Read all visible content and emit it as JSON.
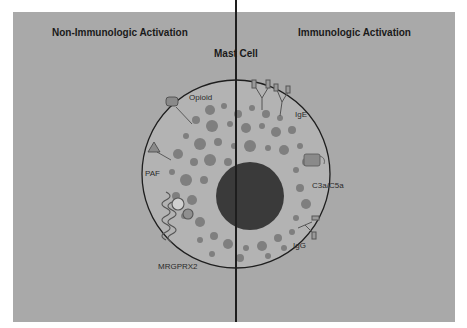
{
  "diagram": {
    "headers": {
      "left": "Non-Immunologic Activation",
      "right": "Immunologic Activation",
      "center": "Mast Cell"
    },
    "labels": {
      "opioid": "Opioid",
      "paf": "PAF",
      "mrgprx2": "MRGPRX2",
      "ige": "IgE",
      "c3a_c5a": "C3a/C5a",
      "igg": "IgG"
    },
    "colors": {
      "background": "#a9a9a9",
      "cell_fill": "#b5b5b5",
      "granule": "#7d7d7d",
      "nucleus": "#3a3a3a",
      "outline": "#1e1e1e"
    }
  }
}
